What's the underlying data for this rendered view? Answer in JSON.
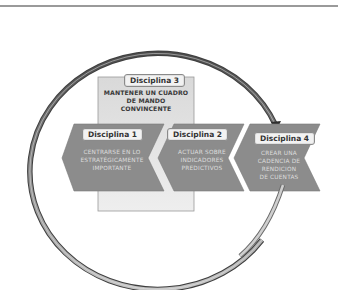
{
  "diagram": {
    "title": "",
    "disciplines": [
      {
        "id": 1,
        "tag": "Disciplina 1",
        "lines": [
          "CENTRARSE EN LO",
          "ESTRATÉGICAMENTE",
          "IMPORTANTE"
        ]
      },
      {
        "id": 2,
        "tag": "Disciplina 2",
        "lines": [
          "ACTUAR SOBRE",
          "INDICADORES",
          "PREDICTIVOS"
        ]
      },
      {
        "id": 3,
        "tag": "Disciplina 3",
        "lines": [
          "MANTENER UN CUADRO",
          "DE MANDO",
          "CONVINCENTE"
        ]
      },
      {
        "id": 4,
        "tag": "Disciplina 4",
        "lines": [
          "CREAR UNA",
          "CADENCIA DE",
          "RENDICIÓN",
          "DE CUENTAS"
        ]
      }
    ],
    "connectors": [
      {
        "type": "circular-loop-arrow",
        "from": "Disciplina 4",
        "to": "Disciplina 4",
        "icon": "loop-arrow-icon"
      }
    ],
    "colors": {
      "chevron_fill": "#8c8c8c",
      "panel_fill": "#e6e6e6",
      "ring_dark": "#5a5a5a",
      "ring_light": "#c8c8c8",
      "tag_fill": "#f2f2f2"
    }
  }
}
